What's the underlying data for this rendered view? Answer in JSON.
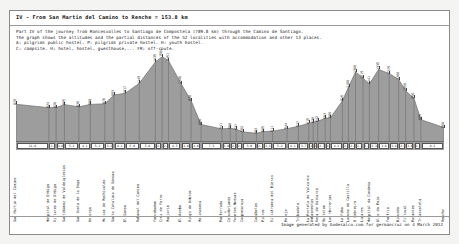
{
  "document": {
    "title": "IV - From San Martin del Camino to Renche = 153.8 km",
    "intro_lines": [
      "Part IV of the journey from Roncesvalles to Santiago de Compostela (789.8 km) through the Camino de Santiago.",
      "The graph shows the altitudes and the partial distances of the 52 localities with accommodation and other 13 places.",
      "A: pilgrims public hostel.   P: pilgrims private hostel.   H: youth hostel.",
      "C: campsite.  H: hotel, hostel, guesthouse,...  FR: off-route."
    ],
    "footer": "Image generated by Godesalco.com for germancruz on 4 March 2012",
    "centre_mark": "*"
  },
  "chart_data": {
    "type": "area",
    "title": "IV - From San Martin del Camino to Renche = 153.8 km",
    "xlabel": "",
    "ylabel": "Altitude (m)",
    "ylim": [
      300,
      1500
    ],
    "xlim": [
      0,
      153.8
    ],
    "grid": false,
    "legend": "none",
    "fill_color": "#9d9d9d",
    "line_color": "#6f6f6f",
    "units": {
      "altitude": "m",
      "distance": "km"
    },
    "categories": [
      "San Martin del Camino",
      "Hospital de Orbigo",
      "Villares de Orbigo",
      "Santibanez de Valdeiglesias",
      "San Justo de la Vega",
      "Astorga",
      "Murias de Rechivaldo",
      "Santa Catalina de Somoza",
      "El Ganso",
      "Rabanal del Camino",
      "Foncebadon",
      "Cruz de Ferro",
      "Manjarin",
      "El Acebo",
      "Riego de Ambros",
      "Molinaseca",
      "Ponferrada",
      "Columbrianos",
      "Fuentes Nuevas",
      "Camponaraya",
      "Cacabelos",
      "Pieros",
      "Villafranca del Bierzo",
      "Pereje",
      "Trabadelo",
      "La Portela de Valcarce",
      "Ambasmestas",
      "Vega de Valcarce",
      "Ruitelan",
      "Las Herrerias",
      "La Faba",
      "Laguna de Castilla",
      "O Cebreiro",
      "Linares",
      "Hospital da Condesa",
      "Alto do Poio",
      "Fonfria",
      "Biduedo",
      "Filloval",
      "Pasantes",
      "Triacastela",
      "Renche"
    ],
    "distances_km": [
      0.0,
      11.8,
      14.4,
      17.4,
      22.6,
      26.7,
      31.9,
      35.2,
      39.3,
      44.3,
      50.1,
      52.5,
      54.8,
      59.3,
      62.9,
      66.5,
      74.0,
      77.0,
      79.1,
      81.4,
      86.4,
      88.9,
      92.2,
      97.4,
      101.5,
      105.2,
      106.8,
      108.4,
      111.1,
      113.0,
      117.3,
      119.5,
      122.0,
      124.7,
      127.0,
      130.3,
      134.1,
      137.5,
      140.0,
      143.0,
      145.5,
      153.8
    ],
    "values": [
      870,
      824,
      826,
      865,
      836,
      868,
      876,
      993,
      1017,
      1149,
      1435,
      1504,
      1451,
      1146,
      920,
      600,
      541,
      550,
      537,
      502,
      483,
      505,
      511,
      544,
      577,
      615,
      630,
      642,
      683,
      690,
      916,
      1100,
      1300,
      1219,
      1141,
      1335,
      1279,
      1200,
      1050,
      950,
      665,
      560
    ],
    "peak_labels": [
      {
        "name": "Cruz de Ferro",
        "altitude": 1504
      },
      {
        "name": "O Cebreiro",
        "altitude": 1300
      },
      {
        "name": "Alto do Poio",
        "altitude": 1335
      }
    ],
    "low_labels": [
      {
        "name": "Cacabelos",
        "altitude": 483
      },
      {
        "name": "Camponaraya",
        "altitude": 502
      }
    ]
  },
  "axis": {
    "km_markers": [
      "11.8",
      "2.6",
      "3.0",
      "5.2",
      "4.1",
      "5.2",
      "3.3",
      "4.1",
      "5.0",
      "5.8",
      "2.4",
      "2.3",
      "4.5",
      "3.6",
      "3.6",
      "7.5",
      "3.0",
      "2.1",
      "2.3",
      "5.0",
      "2.5",
      "3.3",
      "5.2",
      "4.1",
      "3.7",
      "1.6",
      "1.6",
      "2.7",
      "1.9",
      "4.3",
      "2.2",
      "2.5",
      "2.7",
      "2.3",
      "3.3",
      "3.8",
      "3.4",
      "2.5",
      "3.0",
      "2.5",
      "8.3"
    ]
  }
}
